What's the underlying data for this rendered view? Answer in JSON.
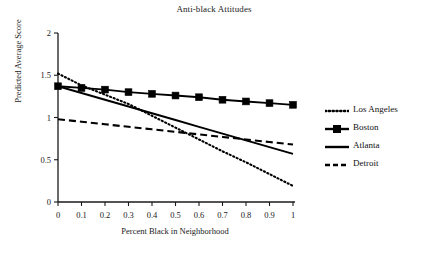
{
  "chart_data": {
    "type": "line",
    "title": "Anti-black Attitudes",
    "xlabel": "Percent Black in Neighborhood",
    "ylabel": "Predicted Average Score",
    "xlim": [
      0,
      1
    ],
    "ylim": [
      0,
      2
    ],
    "xticks": [
      "0",
      "0.1",
      "0.2",
      "0.3",
      "0.4",
      "0.5",
      "0.6",
      "0.7",
      "0.8",
      "0.9",
      "1"
    ],
    "xtick_values": [
      0,
      0.1,
      0.2,
      0.3,
      0.4,
      0.5,
      0.6,
      0.7,
      0.8,
      0.9,
      1
    ],
    "yticks": [
      "0",
      "0.5",
      "1",
      "1.5",
      "2"
    ],
    "ytick_values": [
      0,
      0.5,
      1,
      1.5,
      2
    ],
    "grid": false,
    "legend_position": "right",
    "x": [
      0,
      0.1,
      0.2,
      0.3,
      0.4,
      0.5,
      0.6,
      0.7,
      0.8,
      0.9,
      1
    ],
    "series": [
      {
        "name": "Los Angeles",
        "style": "dotted",
        "marker": "none",
        "color": "#000000",
        "values": [
          1.52,
          1.38,
          1.27,
          1.16,
          1.02,
          0.88,
          0.74,
          0.6,
          0.47,
          0.33,
          0.19
        ]
      },
      {
        "name": "Boston",
        "style": "solid",
        "marker": "square",
        "color": "#000000",
        "values": [
          1.37,
          1.35,
          1.33,
          1.3,
          1.28,
          1.26,
          1.24,
          1.21,
          1.19,
          1.17,
          1.15
        ]
      },
      {
        "name": "Atlanta",
        "style": "solid",
        "marker": "none",
        "color": "#000000",
        "values": [
          1.37,
          1.29,
          1.21,
          1.13,
          1.05,
          0.97,
          0.89,
          0.81,
          0.73,
          0.65,
          0.57
        ]
      },
      {
        "name": "Detroit",
        "style": "dashed",
        "marker": "none",
        "color": "#000000",
        "values": [
          0.98,
          0.95,
          0.92,
          0.89,
          0.86,
          0.83,
          0.8,
          0.77,
          0.74,
          0.71,
          0.68
        ]
      }
    ]
  },
  "legend": {
    "items": [
      {
        "label": "Los Angeles",
        "style": "dotted",
        "marker": "none"
      },
      {
        "label": "Boston",
        "style": "solid",
        "marker": "square"
      },
      {
        "label": "Atlanta",
        "style": "solid",
        "marker": "none"
      },
      {
        "label": "Detroit",
        "style": "dashed",
        "marker": "none"
      }
    ]
  }
}
